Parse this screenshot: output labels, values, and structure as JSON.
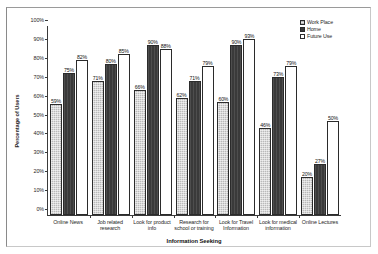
{
  "chart_data": {
    "type": "bar",
    "title": "",
    "xlabel": "Information Seeking",
    "ylabel": "Percentage of Users",
    "ylim": [
      0,
      100
    ],
    "yticks": [
      "0%",
      "10%",
      "20%",
      "30%",
      "40%",
      "50%",
      "60%",
      "70%",
      "80%",
      "90%",
      "100%"
    ],
    "grid": false,
    "legend_position": "top-right",
    "categories": [
      "Online News",
      "Job related research",
      "Look for product info",
      "Research for school or training",
      "Look for Travel Information",
      "Look for medical information",
      "Online Lectures"
    ],
    "series": [
      {
        "name": "Work Place",
        "color": "#b9b9b9",
        "values": [
          59,
          71,
          66,
          62,
          60,
          46,
          20
        ],
        "labels": [
          "59%",
          "71%",
          "66%",
          "62%",
          "60%",
          "46%",
          "20%"
        ]
      },
      {
        "name": "Home",
        "color": "#3a3a3a",
        "values": [
          75,
          80,
          90,
          71,
          90,
          73,
          27
        ],
        "labels": [
          "75%",
          "80%",
          "90%",
          "71%",
          "90%",
          "73%",
          "27%"
        ]
      },
      {
        "name": "Future Use",
        "color": "#ffffff",
        "values": [
          82,
          85,
          88,
          79,
          93,
          79,
          50
        ],
        "labels": [
          "82%",
          "85%",
          "88%",
          "79%",
          "93%",
          "79%",
          "50%"
        ]
      }
    ]
  }
}
